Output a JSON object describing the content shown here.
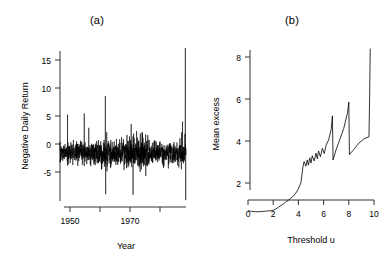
{
  "figure": {
    "background": "#ffffff",
    "line_color": "#000000",
    "axis_color": "#333333"
  },
  "panels": [
    {
      "id": "panel-a",
      "title": "(a)",
      "chart_data": {
        "type": "line",
        "title": "(a)",
        "xlabel": "Year",
        "ylabel": "Negative Daily Return",
        "xlim": [
          1948.0,
          1988.0
        ],
        "ylim": [
          -8.5,
          18.5
        ],
        "xticks": [
          1950,
          1960,
          1970,
          1980
        ],
        "xticklabels": [
          "1950",
          "",
          "1970",
          ""
        ],
        "yticks": [
          -5,
          0,
          5,
          10,
          15
        ],
        "yticklabels": [
          "-5",
          "0",
          "5",
          "10",
          "15"
        ],
        "grid": false,
        "legend": null,
        "series": [
          {
            "name": "Negative daily return",
            "description": "Daily negative returns of a stock index, dense noise band roughly -3 to +3 with occasional large spikes; largest spike near 1987 reaching about 18.",
            "notable_points": [
              {
                "x": 1950.4,
                "y": 6.6
              },
              {
                "x": 1955.7,
                "y": 6.8
              },
              {
                "x": 1962.4,
                "y": 9.8
              },
              {
                "x": 1962.5,
                "y": -7.0
              },
              {
                "x": 1970.6,
                "y": 5.0
              },
              {
                "x": 1971.2,
                "y": -7.1
              },
              {
                "x": 1986.9,
                "y": 5.4
              },
              {
                "x": 1987.8,
                "y": 18.0
              },
              {
                "x": 1987.9,
                "y": -8.0
              }
            ]
          }
        ]
      }
    },
    {
      "id": "panel-b",
      "title": "(b)",
      "chart_data": {
        "type": "line",
        "title": "(b)",
        "xlabel": "Threshold u",
        "ylabel": "Mean excess",
        "xlim": [
          -0.3,
          10.3
        ],
        "ylim": [
          0.2,
          8.8
        ],
        "xticks": [
          0,
          2,
          4,
          6,
          8,
          10
        ],
        "xticklabels": [
          "0",
          "2",
          "4",
          "6",
          "8",
          "10"
        ],
        "yticks": [
          2,
          4,
          6,
          8
        ],
        "yticklabels": [
          "2",
          "4",
          "6",
          "8"
        ],
        "grid": false,
        "legend": null,
        "series": [
          {
            "name": "Mean excess over threshold u",
            "description": "Mean excess function: flat near 0.65 up to u=2, rising steadily to about 2 at u=4.2, then an upward sawtooth with increasing jaggedness, ending in a tall spike to about 8.4 near u=9.7.",
            "x": [
              0.0,
              0.2,
              0.4,
              0.6,
              0.8,
              1.0,
              1.2,
              1.4,
              1.6,
              1.8,
              2.0,
              2.2,
              2.4,
              2.6,
              2.8,
              3.0,
              3.2,
              3.4,
              3.6,
              3.8,
              4.0,
              4.2,
              4.35,
              4.45,
              4.6,
              4.7,
              4.8,
              4.9,
              5.0,
              5.1,
              5.25,
              5.4,
              5.5,
              5.6,
              5.75,
              5.9,
              6.05,
              6.2,
              6.4,
              6.6,
              6.7,
              6.75,
              7.0,
              7.3,
              7.6,
              7.9,
              8.0,
              8.05,
              8.4,
              8.8,
              9.2,
              9.6,
              9.65,
              9.7
            ],
            "y": [
              0.68,
              0.66,
              0.64,
              0.63,
              0.63,
              0.64,
              0.65,
              0.66,
              0.67,
              0.68,
              0.7,
              0.76,
              0.84,
              0.92,
              1.0,
              1.1,
              1.18,
              1.28,
              1.38,
              1.52,
              1.72,
              2.02,
              2.72,
              3.02,
              2.8,
              3.1,
              2.85,
              3.2,
              2.95,
              3.3,
              3.05,
              3.42,
              3.15,
              3.52,
              3.25,
              3.65,
              3.4,
              3.8,
              4.05,
              4.55,
              5.2,
              3.1,
              3.6,
              4.1,
              4.6,
              5.35,
              5.85,
              3.35,
              3.6,
              3.9,
              4.1,
              4.2,
              6.0,
              8.4
            ]
          }
        ]
      }
    }
  ]
}
